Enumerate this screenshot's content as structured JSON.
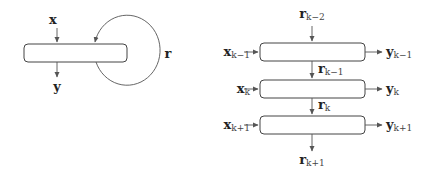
{
  "diagrams": {
    "folded": {
      "input_label": "x",
      "output_label": "y",
      "recurrent_label": "r"
    },
    "unrolled": {
      "top_state": {
        "base": "r",
        "sub": "k−2"
      },
      "steps": [
        {
          "input": {
            "base": "x",
            "sub": "k−1"
          },
          "output": {
            "base": "y",
            "sub": "k−1"
          },
          "state_out": {
            "base": "r",
            "sub": "k−1"
          }
        },
        {
          "input": {
            "base": "x",
            "sub": "k"
          },
          "output": {
            "base": "y",
            "sub": "k"
          },
          "state_out": {
            "base": "r",
            "sub": "k"
          }
        },
        {
          "input": {
            "base": "x",
            "sub": "k+1"
          },
          "output": {
            "base": "y",
            "sub": "k+1"
          },
          "state_out": {
            "base": "r",
            "sub": "k+1"
          }
        }
      ]
    }
  },
  "colors": {
    "stroke": "#555555",
    "text": "#222222"
  }
}
